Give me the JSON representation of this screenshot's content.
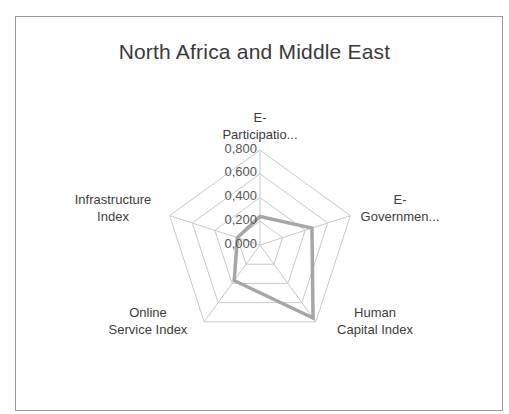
{
  "chart_data": {
    "type": "radar",
    "title": "North Africa and Middle East",
    "categories": [
      "E-Participatio...",
      "E-Governmen...",
      "Human Capital Index",
      "Online Service Index",
      "Infrastructure Index"
    ],
    "series": [
      {
        "name": "North Africa and Middle East",
        "values": [
          0.24,
          0.46,
          0.76,
          0.37,
          0.2
        ],
        "color": "#a6a6a6"
      }
    ],
    "radial_ticks": [
      "0,000",
      "0,200",
      "0,400",
      "0,600",
      "0,800"
    ],
    "rlim": [
      0,
      0.8
    ],
    "grid": true,
    "legend": "none"
  },
  "labels": {
    "title": "North Africa and Middle East",
    "axis_top_line1": "E-",
    "axis_top_line2": "Participatio...",
    "axis_right_line1": "E-",
    "axis_right_line2": "Governmen...",
    "axis_br_line1": "Human",
    "axis_br_line2": "Capital Index",
    "axis_bl_line1": "Online",
    "axis_bl_line2": "Service Index",
    "axis_left_line1": "Infrastructure",
    "axis_left_line2": "Index",
    "tick0": "0,000",
    "tick1": "0,200",
    "tick2": "0,400",
    "tick3": "0,600",
    "tick4": "0,800"
  }
}
